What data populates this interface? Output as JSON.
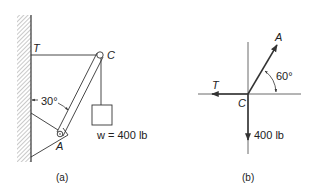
{
  "figure_a": {
    "caption": "(a)",
    "labels": {
      "tension": "T",
      "pin_c": "C",
      "pin_a": "A",
      "angle": "30°",
      "weight": "w = 400 lb"
    },
    "elements": [
      "wall",
      "horizontal-cable",
      "strut",
      "hanging-weight",
      "support-bracket"
    ]
  },
  "figure_b": {
    "caption": "(b)",
    "labels": {
      "tension": "T",
      "origin": "C",
      "strut_force": "A",
      "angle": "60°",
      "weight": "400 lb"
    },
    "forces": [
      {
        "name": "T",
        "direction_deg": 180
      },
      {
        "name": "A",
        "direction_deg": 60
      },
      {
        "name": "400 lb",
        "direction_deg": 270
      }
    ]
  },
  "colors": {
    "line": "#333333",
    "background": "#ffffff"
  }
}
